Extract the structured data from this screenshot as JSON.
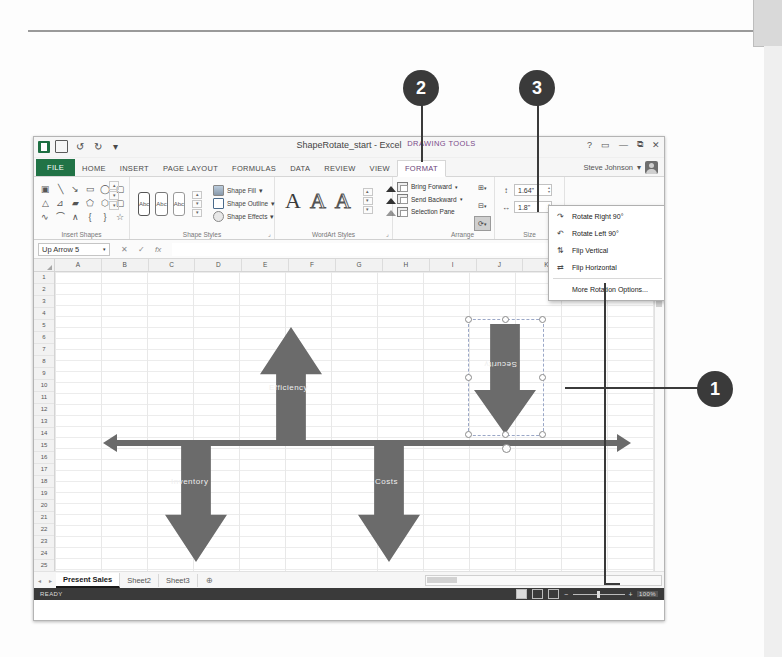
{
  "window": {
    "doc_title": "ShapeRotate_start - Excel",
    "contextual_group": "DRAWING TOOLS",
    "user_name": "Steve Johnson",
    "buttons": {
      "help": "?",
      "ribbon_options": "▭",
      "minimize": "—",
      "restore": "⧉",
      "close": "✕"
    }
  },
  "tabs": [
    {
      "label": "FILE"
    },
    {
      "label": "HOME"
    },
    {
      "label": "INSERT"
    },
    {
      "label": "PAGE LAYOUT"
    },
    {
      "label": "FORMULAS"
    },
    {
      "label": "DATA"
    },
    {
      "label": "REVIEW"
    },
    {
      "label": "VIEW"
    },
    {
      "label": "FORMAT"
    }
  ],
  "ribbon": {
    "groups": {
      "insert_shapes": "Insert Shapes",
      "shape_styles": "Shape Styles",
      "wordart_styles": "WordArt Styles",
      "arrange": "Arrange",
      "size": "Size"
    },
    "shape_fill": "Shape Fill ",
    "shape_outline": "Shape Outline ",
    "shape_effects": "Shape Effects ",
    "bring_forward": "Bring Forward",
    "send_backward": "Send Backward",
    "selection_pane": "Selection Pane",
    "style_preview": "Abc",
    "wordart_letter": "A",
    "size_height": "1.64\"",
    "size_width": "1.8\"",
    "dialog_launcher": "⌟"
  },
  "rotate_menu": [
    {
      "label": "Rotate Right 90°",
      "icon": "rotate-right-icon",
      "underline": "R"
    },
    {
      "label": "Rotate Left 90°",
      "icon": "rotate-left-icon",
      "underline": "L"
    },
    {
      "label": "Flip Vertical",
      "icon": "flip-vertical-icon",
      "underline": "V"
    },
    {
      "label": "Flip Horizontal",
      "icon": "flip-horizontal-icon",
      "underline": "H"
    },
    {
      "label": "More Rotation Options...",
      "icon": "",
      "underline": "M"
    }
  ],
  "formula_bar": {
    "name_box": "Up Arrow 5",
    "dropdown": "▾",
    "cancel": "✕",
    "enter": "✓",
    "function": "fx",
    "value": ""
  },
  "grid": {
    "columns": [
      "A",
      "B",
      "C",
      "D",
      "E",
      "F",
      "G",
      "H",
      "I",
      "J",
      "K",
      "L",
      "M"
    ],
    "rows": [
      1,
      2,
      3,
      4,
      5,
      6,
      7,
      8,
      9,
      10,
      11,
      12,
      13,
      14,
      15,
      16,
      17,
      18,
      19,
      20,
      21,
      22,
      23,
      24,
      25,
      26,
      27
    ]
  },
  "shapes": [
    {
      "name": "up-arrow-efficiency",
      "label": "Efficiency",
      "direction": "up"
    },
    {
      "name": "down-arrow-security-selected",
      "label": "Security",
      "direction": "down",
      "selected": true
    },
    {
      "name": "down-arrow-inventory",
      "label": "Inventory",
      "direction": "down"
    },
    {
      "name": "down-arrow-costs",
      "label": "Costs",
      "direction": "down"
    },
    {
      "name": "double-headed-horizontal-arrow",
      "label": "",
      "direction": "horizontal"
    }
  ],
  "sheet_tabs": [
    {
      "label": "Present Sales",
      "active": true
    },
    {
      "label": "Sheet2",
      "active": false
    },
    {
      "label": "Sheet3",
      "active": false
    }
  ],
  "new_sheet": "⊕",
  "status": {
    "mode": "READY",
    "zoom": "100%",
    "zoom_out": "−",
    "zoom_in": "+"
  },
  "callouts": [
    {
      "number": "1"
    },
    {
      "number": "2"
    },
    {
      "number": "3"
    }
  ],
  "colors": {
    "excel_green": "#217346",
    "shape_gray": "#6b6b6b",
    "callout_dark": "#3a3a3a",
    "contextual_purple": "#7a4a8a"
  }
}
